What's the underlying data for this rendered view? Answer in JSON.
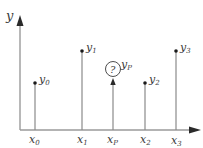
{
  "axes": {
    "y_label": "y",
    "colors": {
      "axis": "#9a9a9a",
      "stem": "#8a8a8a",
      "arrow": "#2a2a2a",
      "dot": "#1a1a1a",
      "text": "#3a3a3a"
    }
  },
  "points": [
    {
      "x_label": "x",
      "x_sub": "0",
      "y_label": "y",
      "y_sub": "0"
    },
    {
      "x_label": "x",
      "x_sub": "1",
      "y_label": "y",
      "y_sub": "1"
    },
    {
      "x_label": "x",
      "x_sub": "2",
      "y_label": "y",
      "y_sub": "2"
    },
    {
      "x_label": "x",
      "x_sub": "3",
      "y_label": "y",
      "y_sub": "3"
    }
  ],
  "query": {
    "x_label": "x",
    "x_sub": "P",
    "y_label": "y",
    "y_sub": "P",
    "marker_text": "?"
  }
}
